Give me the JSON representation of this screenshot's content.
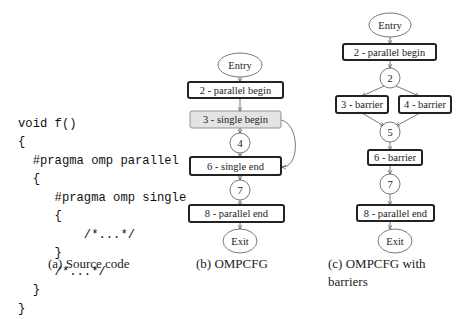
{
  "panel_a": {
    "code_lines": [
      "void f()",
      "{",
      "  #pragma omp parallel",
      "  {",
      "     #pragma omp single",
      "     {",
      "         /*...*/",
      "     }",
      "     /*...*/",
      "  }",
      "}"
    ],
    "caption": "(a) Source code"
  },
  "panel_b": {
    "caption": "(b) OMPCFG",
    "nodes": {
      "entry": "Entry",
      "n2": "2 - parallel begin",
      "n3": "3 - single begin",
      "n4": "4",
      "n6": "6 - single end",
      "n7": "7",
      "n8": "8 - parallel end",
      "exit": "Exit"
    },
    "highlight_color": "#e3e3e3"
  },
  "panel_c": {
    "caption_line1": "(c) OMPCFG with",
    "caption_line2": "barriers",
    "nodes": {
      "entry": "Entry",
      "n2box": "2 - parallel begin",
      "n2": "2",
      "n3": "3 - barrier",
      "n4": "4 - barrier",
      "n5": "5",
      "n6": "6 - barrier",
      "n7": "7",
      "n8": "8 - parallel end",
      "exit": "Exit"
    }
  }
}
